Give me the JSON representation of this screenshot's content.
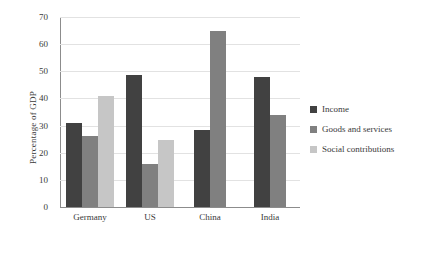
{
  "chart_data": {
    "type": "bar",
    "title": "",
    "xlabel": "",
    "ylabel": "Percentage of GDP",
    "ylim": [
      0,
      70
    ],
    "yticks": [
      0,
      10,
      20,
      30,
      40,
      50,
      60,
      70
    ],
    "grid": true,
    "legend_position": "right",
    "categories": [
      "Germany",
      "US",
      "China",
      "India"
    ],
    "series": [
      {
        "name": "Income",
        "color": "#414141",
        "values": [
          31,
          48.5,
          28.5,
          48
        ]
      },
      {
        "name": "Goods and services",
        "color": "#808080",
        "values": [
          26.3,
          15.8,
          65,
          34
        ]
      },
      {
        "name": "Social contributions",
        "color": "#c6c6c6",
        "values": [
          41,
          24.6,
          null,
          null
        ]
      }
    ]
  },
  "axis": {
    "y_title": "Percentage of GDP"
  }
}
